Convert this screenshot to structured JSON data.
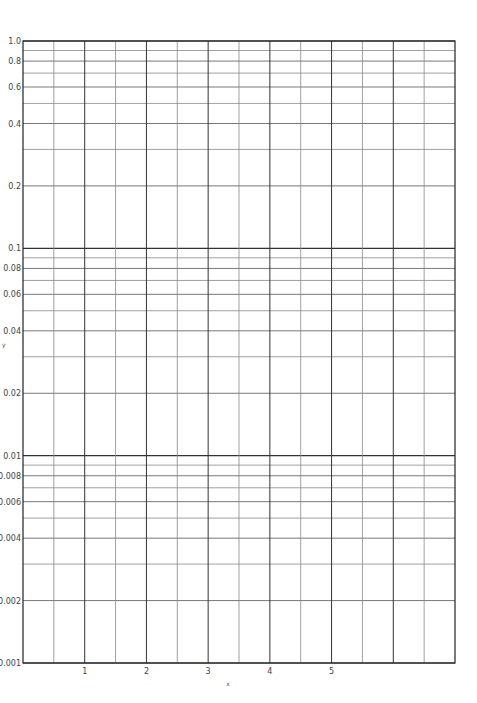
{
  "chart_data": {
    "type": "line",
    "title": "",
    "xlabel": "x",
    "ylabel": "y",
    "yscale": "log",
    "xlim": [
      0,
      7
    ],
    "ylim": [
      0.001,
      1.0
    ],
    "grid": true,
    "legend": null,
    "x_ticks": [
      1,
      2,
      3,
      4,
      5
    ],
    "x_tick_labels": [
      "1",
      "2",
      "3",
      "4",
      "5"
    ],
    "x_minor_grid_step": 0.5,
    "y_ticks": [
      1.0,
      0.8,
      0.6,
      0.4,
      0.2,
      0.1,
      0.08,
      0.06,
      0.04,
      0.02,
      0.01,
      0.008,
      0.006,
      0.004,
      0.002,
      0.001
    ],
    "y_tick_labels": [
      "1.0",
      "0.8",
      "0.6",
      "0.4",
      "0.2",
      "0.1",
      "0.08",
      "0.06",
      "0.04",
      "0.02",
      "0.01",
      "0.008",
      "0.006",
      "0.004",
      "0.002",
      "0.001"
    ],
    "y_grid_lines": [
      1.0,
      0.9,
      0.8,
      0.7,
      0.6,
      0.5,
      0.4,
      0.3,
      0.2,
      0.1,
      0.09,
      0.08,
      0.07,
      0.06,
      0.05,
      0.04,
      0.03,
      0.02,
      0.01,
      0.009,
      0.008,
      0.007,
      0.006,
      0.005,
      0.004,
      0.003,
      0.002,
      0.001
    ],
    "series": []
  },
  "layout": {
    "plot_left": 23,
    "plot_right": 455,
    "plot_top": 41,
    "plot_bottom": 663,
    "colors": {
      "axis": "#222222",
      "major_grid": "#333333",
      "minor_grid": "#888888",
      "text": "#444444"
    }
  }
}
